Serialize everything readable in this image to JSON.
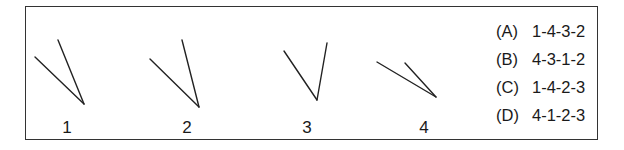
{
  "figures": [
    {
      "label": "1",
      "lines": [
        [
          35,
          57,
          84,
          104
        ],
        [
          58,
          40,
          84,
          104
        ]
      ],
      "label_x": 57
    },
    {
      "label": "2",
      "lines": [
        [
          150,
          59,
          199,
          107
        ],
        [
          182,
          40,
          199,
          107
        ]
      ],
      "label_x": 177
    },
    {
      "label": "3",
      "lines": [
        [
          284,
          51,
          317,
          100
        ],
        [
          327,
          43,
          317,
          100
        ]
      ],
      "label_x": 297
    },
    {
      "label": "4",
      "lines": [
        [
          377,
          62,
          436,
          97
        ],
        [
          405,
          63,
          436,
          97
        ]
      ],
      "label_x": 414
    }
  ],
  "options": [
    {
      "key": "(A)",
      "value": "1-4-3-2"
    },
    {
      "key": "(B)",
      "value": "4-3-1-2"
    },
    {
      "key": "(C)",
      "value": "1-4-2-3"
    },
    {
      "key": "(D)",
      "value": "4-1-2-3"
    }
  ]
}
